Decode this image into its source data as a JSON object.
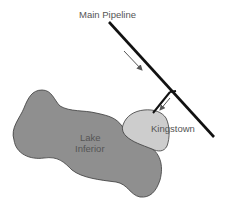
{
  "labels": {
    "pipeline": "Main Pipeline",
    "town": "Kingstown",
    "lake_line1": "Lake",
    "lake_line2": "Inferior"
  },
  "colors": {
    "lake_fill": "#8f8f8f",
    "town_fill": "#cdcdcd",
    "outline": "#3a3a3a",
    "pipe": "#111111",
    "arrow": "#555555"
  },
  "elements": [
    {
      "name": "main-pipeline",
      "type": "line"
    },
    {
      "name": "branch-pipe",
      "type": "double-line"
    },
    {
      "name": "flow-arrow-main",
      "direction": "down-right"
    },
    {
      "name": "flow-arrow-branch",
      "direction": "down-left"
    },
    {
      "name": "lake-inferior",
      "type": "region"
    },
    {
      "name": "kingstown",
      "type": "region"
    }
  ]
}
